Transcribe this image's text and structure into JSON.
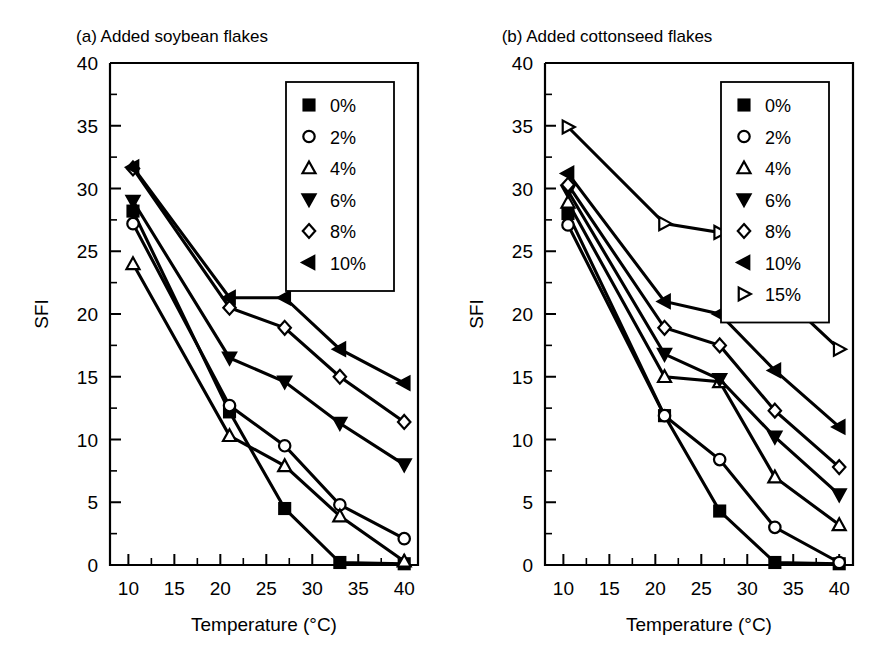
{
  "figure": {
    "background": "#ffffff",
    "ink": "#000000",
    "panels": [
      "a",
      "b"
    ]
  },
  "chart_data": [
    {
      "type": "line",
      "panel": "a",
      "title": "(a) Added soybean flakes",
      "xlabel": "Temperature (°C)",
      "ylabel": "SFI",
      "xlim": [
        8,
        41.5
      ],
      "ylim": [
        0,
        40
      ],
      "xticks": [
        10,
        15,
        20,
        25,
        30,
        35,
        40
      ],
      "xticklabels": [
        "10",
        "15",
        "20",
        "25",
        "30",
        "35",
        "40"
      ],
      "xminorticks": [
        12.5,
        17.5,
        22.5,
        27.5,
        32.5,
        37.5
      ],
      "yticks": [
        0,
        5,
        10,
        15,
        20,
        25,
        30,
        35,
        40
      ],
      "yticklabels": [
        "0",
        "5",
        "10",
        "15",
        "20",
        "25",
        "30",
        "35",
        "40"
      ],
      "yminorticks": [
        2.5,
        7.5,
        12.5,
        17.5,
        22.5,
        27.5,
        32.5,
        37.5
      ],
      "grid": false,
      "legend_position": "top-right",
      "x": [
        10.5,
        21.0,
        27.0,
        33.0,
        40.0
      ],
      "series": [
        {
          "name": "0%",
          "marker": "square",
          "fill": "filled",
          "values": [
            28.2,
            12.2,
            4.5,
            0.2,
            0.1
          ]
        },
        {
          "name": "2%",
          "marker": "circle",
          "fill": "open",
          "values": [
            27.2,
            12.7,
            9.5,
            4.8,
            2.1
          ]
        },
        {
          "name": "4%",
          "marker": "triangle-up",
          "fill": "open",
          "values": [
            24.0,
            10.3,
            7.9,
            3.9,
            0.3
          ]
        },
        {
          "name": "6%",
          "marker": "triangle-down",
          "fill": "filled",
          "values": [
            29.0,
            16.5,
            14.6,
            11.3,
            8.0
          ]
        },
        {
          "name": "8%",
          "marker": "diamond",
          "fill": "open",
          "values": [
            31.6,
            20.5,
            18.9,
            15.0,
            11.4
          ]
        },
        {
          "name": "10%",
          "marker": "triangle-left",
          "fill": "filled",
          "values": [
            31.7,
            21.3,
            21.3,
            17.2,
            14.5
          ]
        }
      ]
    },
    {
      "type": "line",
      "panel": "b",
      "title": "(b) Added cottonseed flakes",
      "xlabel": "Temperature (°C)",
      "ylabel": "SFI",
      "xlim": [
        8,
        41.5
      ],
      "ylim": [
        0,
        40
      ],
      "xticks": [
        10,
        15,
        20,
        25,
        30,
        35,
        40
      ],
      "xticklabels": [
        "10",
        "15",
        "20",
        "25",
        "30",
        "35",
        "40"
      ],
      "xminorticks": [
        12.5,
        17.5,
        22.5,
        27.5,
        32.5,
        37.5
      ],
      "yticks": [
        0,
        5,
        10,
        15,
        20,
        25,
        30,
        35,
        40
      ],
      "yticklabels": [
        "0",
        "5",
        "10",
        "15",
        "20",
        "25",
        "30",
        "35",
        "40"
      ],
      "yminorticks": [
        2.5,
        7.5,
        12.5,
        17.5,
        22.5,
        27.5,
        32.5,
        37.5
      ],
      "grid": false,
      "legend_position": "top-right",
      "x": [
        10.5,
        21.0,
        27.0,
        33.0,
        40.0
      ],
      "series": [
        {
          "name": "0%",
          "marker": "square",
          "fill": "filled",
          "values": [
            28.0,
            11.9,
            4.3,
            0.2,
            0.1
          ]
        },
        {
          "name": "2%",
          "marker": "circle",
          "fill": "open",
          "values": [
            27.1,
            11.9,
            8.4,
            3.0,
            0.2
          ]
        },
        {
          "name": "4%",
          "marker": "triangle-up",
          "fill": "open",
          "values": [
            28.9,
            15.0,
            14.6,
            7.0,
            3.2
          ]
        },
        {
          "name": "6%",
          "marker": "triangle-down",
          "fill": "filled",
          "values": [
            29.8,
            16.8,
            14.8,
            10.2,
            5.6
          ]
        },
        {
          "name": "8%",
          "marker": "diamond",
          "fill": "open",
          "values": [
            30.3,
            18.9,
            17.5,
            12.3,
            7.8
          ]
        },
        {
          "name": "10%",
          "marker": "triangle-left",
          "fill": "filled",
          "values": [
            31.2,
            21.0,
            20.0,
            15.5,
            11.0
          ]
        },
        {
          "name": "15%",
          "marker": "triangle-right",
          "fill": "open",
          "values": [
            34.9,
            27.2,
            26.5,
            22.0,
            17.2
          ]
        }
      ]
    }
  ]
}
